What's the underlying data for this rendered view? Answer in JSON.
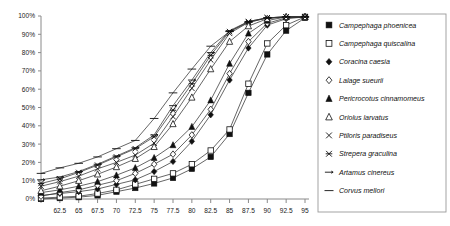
{
  "chart_data": {
    "type": "line",
    "title": "",
    "xlabel": "",
    "ylabel": "",
    "xlim": [
      60,
      95
    ],
    "ylim": [
      0,
      100
    ],
    "grid": false,
    "legend_position": "right",
    "y_tick_labels": [
      "0%",
      "10%",
      "20%",
      "30%",
      "40%",
      "50%",
      "60%",
      "70%",
      "80%",
      "90%",
      "100%"
    ],
    "y_tick_values": [
      0,
      10,
      20,
      30,
      40,
      50,
      60,
      70,
      80,
      90,
      100
    ],
    "x_tick_values": [
      60,
      62.5,
      65,
      67.5,
      70,
      72.5,
      75,
      77.5,
      80,
      82.5,
      85,
      87.5,
      90,
      92.5,
      95
    ],
    "x_tick_labels": [
      "",
      "62.5",
      "65",
      "67.5",
      "70",
      "72.5",
      "75",
      "77.5",
      "80",
      "82.5",
      "85",
      "87.5",
      "90",
      "92.5",
      "95"
    ],
    "x": [
      60,
      62.5,
      65,
      67.5,
      70,
      72.5,
      75,
      77.5,
      80,
      82.5,
      85,
      87.5,
      90,
      92.5,
      95
    ],
    "series": [
      {
        "name": "Campephaga phoenicea",
        "marker": "filled-square",
        "values": [
          0,
          0.5,
          1,
          2,
          4,
          6,
          8.5,
          11.5,
          16.5,
          23,
          35.5,
          58,
          79,
          92,
          99
        ]
      },
      {
        "name": "Campephaga quiscalina",
        "marker": "open-square",
        "values": [
          0.5,
          1,
          1.5,
          3,
          5,
          8,
          11,
          14,
          19,
          26.5,
          38,
          63,
          85,
          95,
          99.5
        ]
      },
      {
        "name": "Coracina caesia",
        "marker": "filled-diamond",
        "values": [
          2,
          3,
          4,
          5.5,
          8,
          10.5,
          15,
          20.5,
          31.5,
          46,
          65,
          82.5,
          95,
          98.5,
          99.5
        ]
      },
      {
        "name": "Lalage sueurii",
        "marker": "open-diamond",
        "values": [
          1.5,
          3.5,
          5,
          7.5,
          10,
          14,
          19,
          24.5,
          35,
          49,
          68.5,
          86,
          96,
          99,
          99.5
        ]
      },
      {
        "name": "Pericrocotus cinnamomeus",
        "marker": "filled-triangle",
        "values": [
          3.5,
          5,
          7,
          9.5,
          13,
          17,
          22.5,
          29.5,
          39.5,
          54,
          74,
          90.5,
          97.5,
          99.5,
          99.5
        ]
      },
      {
        "name": "Oriolus larvatus",
        "marker": "open-triangle",
        "values": [
          4.5,
          7,
          10,
          13.5,
          17.5,
          22,
          28.5,
          41,
          55.5,
          71,
          86,
          94.5,
          98.5,
          99.5,
          99.5
        ]
      },
      {
        "name": "Ptiloris paradiseus",
        "marker": "x-cross",
        "values": [
          7,
          9.5,
          12.5,
          16.5,
          20,
          24,
          30.5,
          45,
          60.5,
          76,
          90.5,
          96.5,
          99,
          99.5,
          99.5
        ]
      },
      {
        "name": "Strepera graculina",
        "marker": "star-cross",
        "values": [
          8.5,
          11,
          14.5,
          18.5,
          23,
          27.5,
          34,
          48.5,
          63,
          78.5,
          91.5,
          97,
          99,
          99.5,
          99.5
        ]
      },
      {
        "name": "Artamus cinereus",
        "marker": "dash-arrow",
        "values": [
          10.5,
          12,
          15,
          19,
          23.5,
          28,
          35,
          51,
          65,
          80,
          92,
          97,
          99,
          99.5,
          99.5
        ]
      },
      {
        "name": "Corvus mellori",
        "marker": "long-dash",
        "values": [
          14,
          17,
          19.5,
          23,
          27.5,
          32,
          44,
          58,
          71,
          83.5,
          91.5,
          96.5,
          99,
          99.5,
          99.5
        ]
      }
    ]
  },
  "legend": {
    "items": [
      {
        "label": "Campephaga phoenicea",
        "marker": "filled-square"
      },
      {
        "label": "Campephaga quiscalina",
        "marker": "open-square"
      },
      {
        "label": "Coracina caesia",
        "marker": "filled-diamond"
      },
      {
        "label": "Lalage sueurii",
        "marker": "open-diamond"
      },
      {
        "label": "Pericrocotus cinnamomeus",
        "marker": "filled-triangle"
      },
      {
        "label": "Oriolus larvatus",
        "marker": "open-triangle"
      },
      {
        "label": "Ptiloris paradiseus",
        "marker": "x-cross"
      },
      {
        "label": "Strepera graculina",
        "marker": "star-cross"
      },
      {
        "label": "Artamus cinereus",
        "marker": "dash-arrow"
      },
      {
        "label": "Corvus mellori",
        "marker": "long-dash"
      }
    ]
  }
}
